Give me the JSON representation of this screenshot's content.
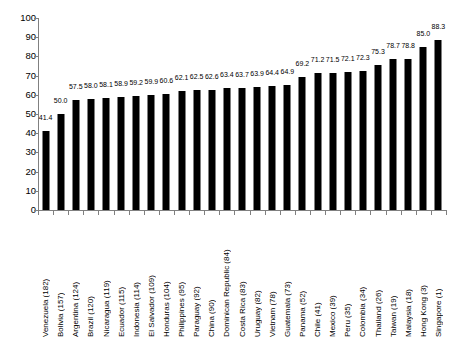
{
  "chart_data": {
    "type": "bar",
    "title": "",
    "subtitle": "",
    "xlabel": "",
    "ylabel": "",
    "ylim": [
      0,
      100
    ],
    "ytick_step": 10,
    "yticks": [
      0,
      10,
      20,
      30,
      40,
      50,
      60,
      70,
      80,
      90,
      100
    ],
    "grid": false,
    "legend": null,
    "legend_position": "none",
    "bar_color": "#000000",
    "axis_color": "#808080",
    "data_labels_shown": true,
    "categories": [
      "Venezuela (182)",
      "Bolivia (157)",
      "Argentina (124)",
      "Brazil (120)",
      "Nicaragua (119)",
      "Ecuador (115)",
      "Indonesia (114)",
      "El Salvador (109)",
      "Honduras (104)",
      "Philippines (95)",
      "Paraguay (92)",
      "China (90)",
      "Dominican Republic (84)",
      "Costa Rica (83)",
      "Uruguay (82)",
      "Vietnam (78)",
      "Guatemala (73)",
      "Panama (52)",
      "Chile (41)",
      "Mexico (39)",
      "Peru (35)",
      "Colombia (34)",
      "Thailand (26)",
      "Taiwan (19)",
      "Malaysia (18)",
      "Hong Kong (3)",
      "Singapore (1)"
    ],
    "values": [
      41.4,
      50.0,
      57.5,
      58.0,
      58.1,
      58.9,
      59.2,
      59.9,
      60.6,
      62.1,
      62.5,
      62.6,
      63.4,
      63.7,
      63.9,
      64.4,
      64.9,
      69.2,
      71.2,
      71.5,
      72.1,
      72.3,
      75.3,
      78.7,
      78.8,
      85.0,
      88.3
    ],
    "value_labels": [
      "41.4",
      "50.0",
      "57.5",
      "58.0",
      "58.1",
      "58.9",
      "59.2",
      "59.9",
      "60.6",
      "62.1",
      "62.5",
      "62.6",
      "63.4",
      "63.7",
      "63.9",
      "64.4",
      "64.9",
      "69.2",
      "71.2",
      "71.5",
      "72.1",
      "72.3",
      "75.3",
      "78.7",
      "78.8",
      "85.0",
      "88.3"
    ]
  }
}
